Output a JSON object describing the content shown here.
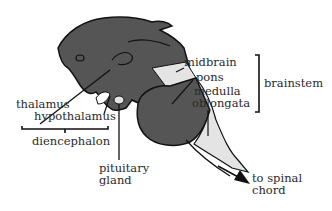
{
  "diagram": {
    "colors": {
      "dark_region": "#555555",
      "light_region": "#e4e4e4",
      "outline": "#111111",
      "text": "#2a2a2a"
    },
    "labels": {
      "thalamus": "thalamus",
      "hypothalamus": "hypothalamus",
      "diencephalon": "diencephalon",
      "pituitary_line1": "pituitary",
      "pituitary_line2": "gland",
      "midbrain": "midbrain",
      "pons": "pons",
      "medulla_line1": "medulla",
      "medulla_line2": "oblongata",
      "brainstem": "brainstem",
      "spinal_line1": "to spinal",
      "spinal_line2": "chord"
    },
    "groups": [
      {
        "name": "diencephalon",
        "members": [
          "thalamus",
          "hypothalamus"
        ]
      },
      {
        "name": "brainstem",
        "members": [
          "midbrain",
          "pons",
          "medulla oblongata"
        ]
      }
    ]
  }
}
